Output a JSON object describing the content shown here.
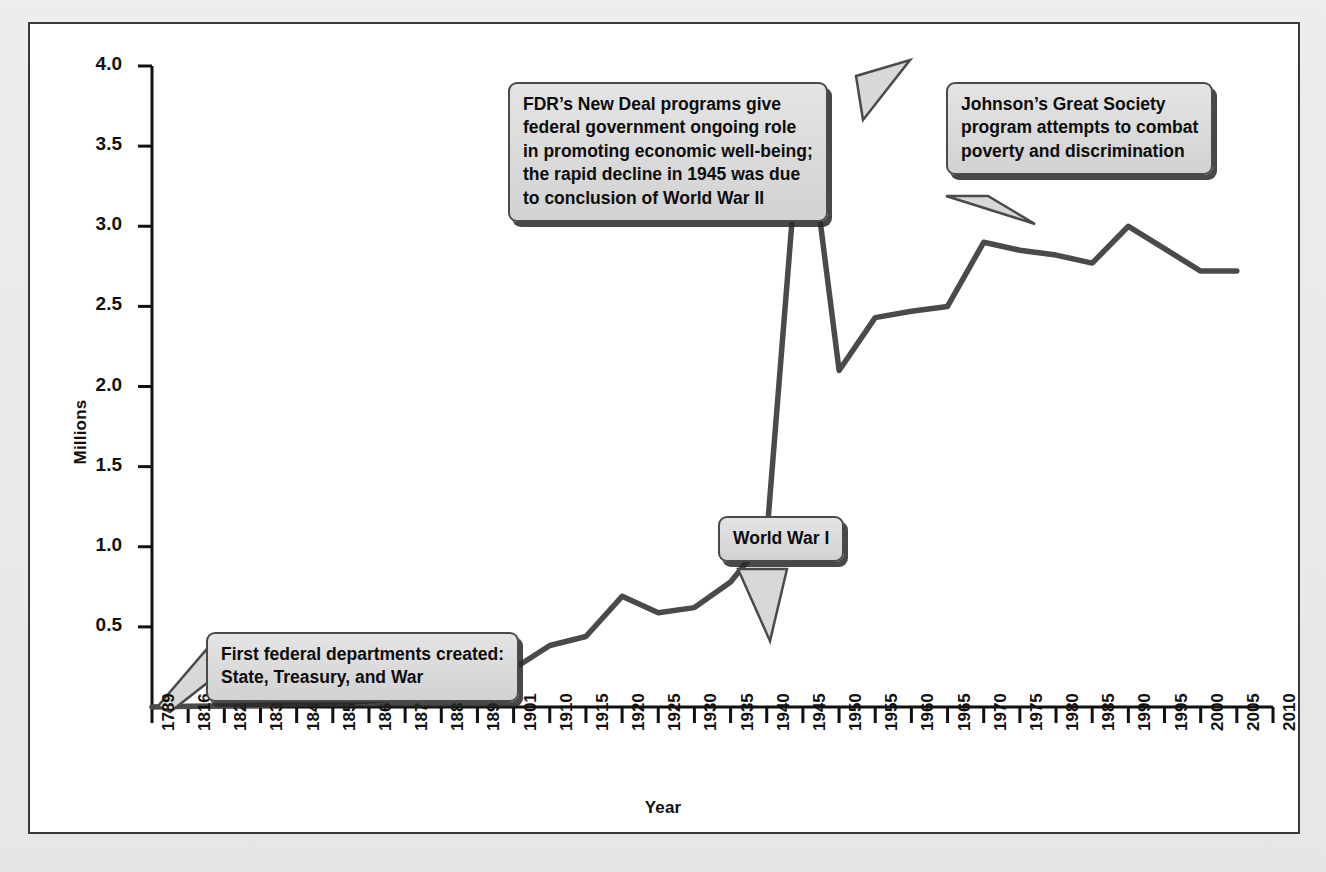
{
  "axes": {
    "y_label": "Millions",
    "x_label": "Year"
  },
  "callouts": [
    {
      "id": "first-federal-departments",
      "lines": [
        "First federal departments created:",
        "State, Treasury, and War"
      ]
    },
    {
      "id": "world-war-one",
      "lines": [
        "World War I"
      ]
    },
    {
      "id": "fdr-new-deal",
      "lines": [
        "FDR’s New Deal programs give",
        "federal government ongoing role",
        "in promoting economic well-being;",
        "the rapid decline in 1945 was due",
        "to conclusion of World War II"
      ]
    },
    {
      "id": "johnson-great-society",
      "lines": [
        "Johnson’s Great Society",
        "program attempts to combat",
        "poverty and discrimination"
      ]
    }
  ],
  "chart_data": {
    "type": "line",
    "title": "",
    "xlabel": "Year",
    "ylabel": "Millions",
    "ylim": [
      0,
      4.0
    ],
    "yticks": [
      0.5,
      1.0,
      1.5,
      2.0,
      2.5,
      3.0,
      3.5,
      4.0
    ],
    "ytick_labels": [
      "0.5",
      "1.0",
      "1.5",
      "2.0",
      "2.5",
      "3.0",
      "3.5",
      "4.0"
    ],
    "grid": false,
    "legend": "none",
    "line_color": "#4a4a4a",
    "categories": [
      "1789",
      "1816",
      "1821",
      "1831",
      "1841",
      "1851",
      "1861",
      "1871",
      "1881",
      "1891",
      "1901",
      "1910",
      "1915",
      "1920",
      "1925",
      "1930",
      "1935",
      "1940",
      "1945",
      "1950",
      "1955",
      "1960",
      "1965",
      "1970",
      "1975",
      "1980",
      "1985",
      "1990",
      "1995",
      "2000",
      "2005",
      "2010"
    ],
    "values": [
      0.0,
      0.005,
      0.007,
      0.011,
      0.018,
      0.026,
      0.037,
      0.051,
      0.1,
      0.166,
      0.239,
      0.384,
      0.44,
      0.691,
      0.588,
      0.62,
      0.78,
      1.06,
      3.88,
      2.1,
      2.43,
      2.47,
      2.5,
      2.9,
      2.85,
      2.82,
      2.77,
      3.0,
      2.86,
      2.72,
      2.72,
      null
    ],
    "series": [
      {
        "name": "Federal civilian employment",
        "values": [
          0.0,
          0.005,
          0.007,
          0.011,
          0.018,
          0.026,
          0.037,
          0.051,
          0.1,
          0.166,
          0.239,
          0.384,
          0.44,
          0.691,
          0.588,
          0.62,
          0.78,
          1.06,
          3.88,
          2.1,
          2.43,
          2.47,
          2.5,
          2.9,
          2.85,
          2.82,
          2.77,
          3.0,
          2.86,
          2.72,
          2.72,
          null
        ]
      }
    ],
    "annotations": [
      {
        "text": "First federal departments created: State, Treasury, and War",
        "points_to_year": "1789"
      },
      {
        "text": "World War I",
        "points_to_year": "1918"
      },
      {
        "text": "FDR’s New Deal programs give federal government ongoing role in promoting economic well-being; the rapid decline in 1945 was due to conclusion of World War II",
        "points_to_year": "1945"
      },
      {
        "text": "Johnson’s Great Society program attempts to combat poverty and discrimination",
        "points_to_year": "1970"
      }
    ]
  }
}
